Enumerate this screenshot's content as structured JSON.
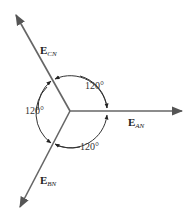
{
  "diagram": {
    "title": "",
    "phasors": [
      {
        "id": "AN",
        "main": "E",
        "sub": "AN"
      },
      {
        "id": "BN",
        "main": "E",
        "sub": "BN"
      },
      {
        "id": "CN",
        "main": "E",
        "sub": "CN"
      }
    ],
    "angles": [
      {
        "between": "AN-CN",
        "label": "120°"
      },
      {
        "between": "CN-BN",
        "label": "120°"
      },
      {
        "between": "BN-AN",
        "label": "120°"
      }
    ],
    "colors": {
      "line": "#666666",
      "arc": "#333333"
    }
  }
}
